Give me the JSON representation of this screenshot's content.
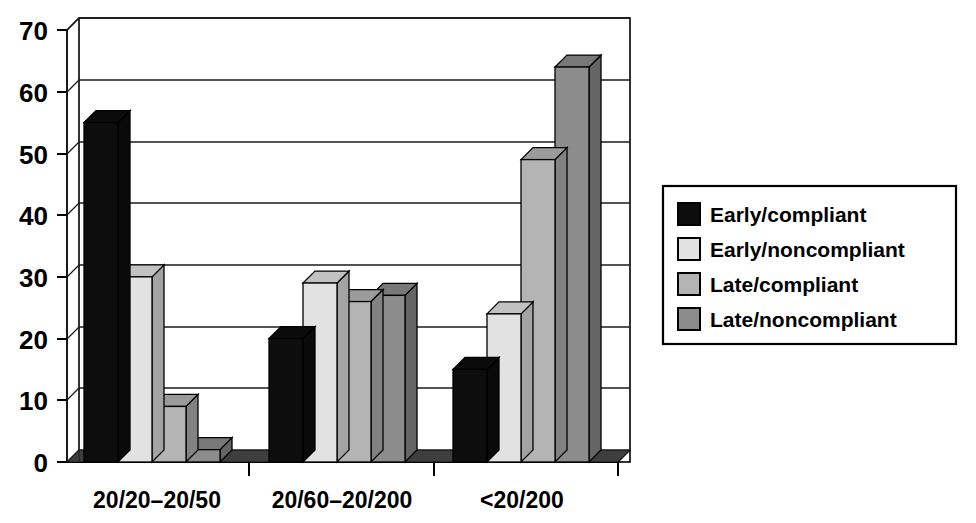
{
  "chart_data": {
    "type": "bar",
    "title": "",
    "subtitle": "",
    "xlabel": "",
    "ylabel": "",
    "ylim": [
      0,
      70
    ],
    "y_ticks": [
      0,
      10,
      20,
      30,
      40,
      50,
      60,
      70
    ],
    "y_tick_labels": [
      "0",
      "10",
      "20",
      "30",
      "40",
      "50",
      "60",
      "70"
    ],
    "grid": true,
    "grid_axis": "y",
    "style": "3d-clustered-bar",
    "legend_position": "right",
    "categories": [
      "20/20–20/50",
      "20/60–20/200",
      "<20/200"
    ],
    "series": [
      {
        "name": "Early/compliant",
        "color": "#0d0d0d",
        "values": [
          55,
          20,
          15
        ]
      },
      {
        "name": "Early/noncompliant",
        "color": "#e2e2e2",
        "values": [
          30,
          29,
          24
        ]
      },
      {
        "name": "Late/compliant",
        "color": "#b4b4b4",
        "values": [
          9,
          26,
          49
        ]
      },
      {
        "name": "Late/noncompliant",
        "color": "#8c8c8c",
        "values": [
          2,
          27,
          64
        ]
      }
    ]
  },
  "legend": {
    "items": [
      {
        "label": "Early/compliant",
        "swatch": "#0d0d0d"
      },
      {
        "label": "Early/noncompliant",
        "swatch": "#e2e2e2"
      },
      {
        "label": "Late/compliant",
        "swatch": "#b4b4b4"
      },
      {
        "label": "Late/noncompliant",
        "swatch": "#8c8c8c"
      }
    ]
  },
  "axis": {
    "y_labels": [
      "70",
      "60",
      "50",
      "40",
      "30",
      "20",
      "10",
      "0"
    ],
    "x_labels": [
      "20/20–20/50",
      "20/60–20/200",
      "<20/200"
    ]
  },
  "colors": {
    "axis_line": "#000000",
    "grid_line": "#1a1a1a",
    "floor": "#2e2e2e",
    "background": "#ffffff",
    "legend_border": "#000000"
  }
}
